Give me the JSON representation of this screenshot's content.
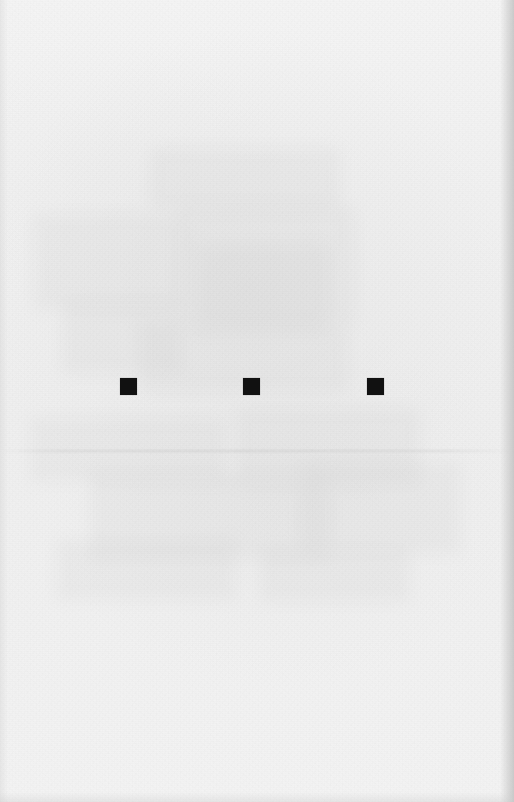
{
  "page": {
    "kind": "scanned-blank-page",
    "width": 514,
    "height": 802,
    "background_color": "#f1f1f1",
    "ink_color": "#111111"
  },
  "markers": {
    "label": "square-marker-row",
    "count": 3,
    "shape": "square",
    "fill_color": "#111111",
    "size_px": 17,
    "baseline_y": 378,
    "spacing_px": 123,
    "items": [
      {
        "name": "square-marker-1",
        "x": 120,
        "y": 378,
        "size": 17
      },
      {
        "name": "square-marker-2",
        "x": 243,
        "y": 378,
        "size": 17
      },
      {
        "name": "square-marker-3",
        "x": 367,
        "y": 378,
        "size": 17
      }
    ]
  },
  "artifacts": {
    "label": "scan-artifacts",
    "tonal_seam_y": 450,
    "ghost_blocks": [
      {
        "x": 34,
        "y": 214,
        "w": 150,
        "h": 96
      },
      {
        "x": 178,
        "y": 206,
        "w": 176,
        "h": 118
      },
      {
        "x": 196,
        "y": 246,
        "w": 132,
        "h": 86
      },
      {
        "x": 62,
        "y": 300,
        "w": 118,
        "h": 74
      },
      {
        "x": 140,
        "y": 322,
        "w": 208,
        "h": 70
      },
      {
        "x": 30,
        "y": 418,
        "w": 196,
        "h": 64
      },
      {
        "x": 236,
        "y": 408,
        "w": 184,
        "h": 78
      },
      {
        "x": 90,
        "y": 472,
        "w": 240,
        "h": 88
      },
      {
        "x": 300,
        "y": 462,
        "w": 160,
        "h": 92
      },
      {
        "x": 56,
        "y": 540,
        "w": 180,
        "h": 60
      },
      {
        "x": 260,
        "y": 548,
        "w": 150,
        "h": 54
      },
      {
        "x": 150,
        "y": 148,
        "w": 190,
        "h": 62
      }
    ]
  }
}
